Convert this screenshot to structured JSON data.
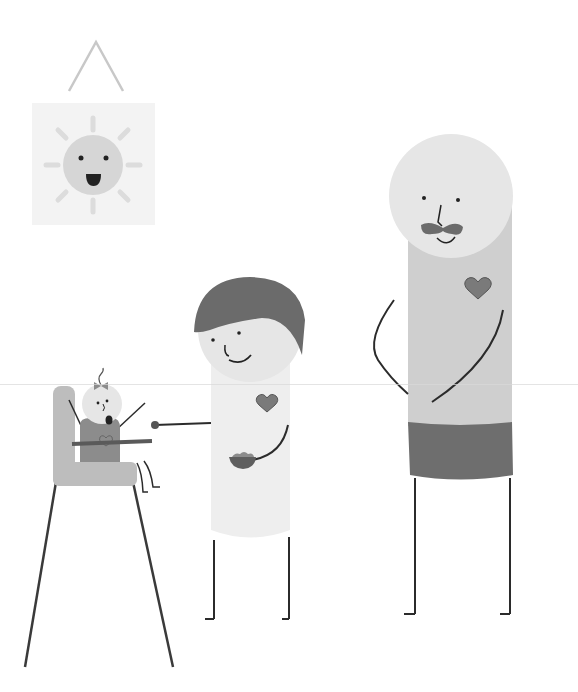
{
  "scene": {
    "description": "Grayscale flat illustration of a family: baby in high chair being fed, child holding a bowl and spoon, tall adult with mustache",
    "colors": {
      "background": "#ffffff",
      "sun_frame": "#f3f3f3",
      "sun": "#d6d6d6",
      "sun_rays": "#dcdcdc",
      "hanger": "#c8c8c8",
      "skin": "#e6e6e6",
      "hair": "#6b6b6b",
      "shirt_child": "#eeeeee",
      "shirt_adult": "#cfcfcf",
      "shorts_adult": "#6e6e6e",
      "heart": "#7a7a7a",
      "chair": "#bdbdbd",
      "baby_body": "#8c8c8c",
      "tray": "#5a5a5a",
      "line": "#2b2b2b"
    }
  },
  "characters": [
    {
      "id": "baby",
      "features": [
        "bow",
        "curl",
        "open-mouth",
        "heart"
      ]
    },
    {
      "id": "child",
      "features": [
        "hair",
        "smile",
        "heart",
        "spoon",
        "bowl"
      ]
    },
    {
      "id": "adult",
      "features": [
        "mustache",
        "smile",
        "heart",
        "shorts"
      ]
    }
  ],
  "objects": [
    "sun-picture",
    "high-chair"
  ]
}
